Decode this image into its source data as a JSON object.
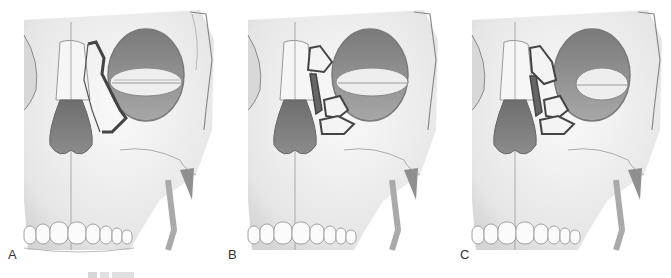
{
  "figure": {
    "panels": [
      {
        "id": "A",
        "label": "A",
        "fracture_variant": "single-segment"
      },
      {
        "id": "B",
        "label": "B",
        "fracture_variant": "comminuted"
      },
      {
        "id": "C",
        "label": "C",
        "fracture_variant": "comminuted-extended"
      }
    ],
    "caption_visible": false
  },
  "colors": {
    "bone": "#f2f2f2",
    "bone_shade": "#cfcfcf",
    "outline": "#8a8a8a",
    "nasal_cavity": "#7c7c7c",
    "orbit": "#8e8e8e",
    "fracture_line": "#444444",
    "fracture_fill": "#666666"
  }
}
